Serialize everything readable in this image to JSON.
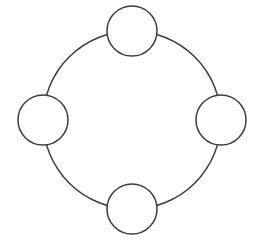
{
  "diagram": {
    "background_color": "#ffffff",
    "stroke_color": "#3c3c3c",
    "stroke_width": 1.5,
    "canvas": {
      "width": 257,
      "height": 248
    }
  },
  "chart_data": {
    "type": "diagram",
    "subtype": "ring-network-topology",
    "title": "",
    "ring": {
      "center_x": 132,
      "center_y": 120,
      "radius": 89,
      "label": "ring-backbone"
    },
    "nodes": [
      {
        "id": "node-top",
        "position": "top",
        "cx": 132,
        "cy": 31,
        "r": 25,
        "label": ""
      },
      {
        "id": "node-right",
        "position": "right",
        "cx": 221,
        "cy": 120,
        "r": 25,
        "label": ""
      },
      {
        "id": "node-bottom",
        "position": "bottom",
        "cx": 132,
        "cy": 209,
        "r": 25,
        "label": ""
      },
      {
        "id": "node-left",
        "position": "left",
        "cx": 43,
        "cy": 120,
        "r": 25,
        "label": ""
      }
    ],
    "edges": [
      {
        "from": "node-top",
        "to": "node-right",
        "shape": "arc"
      },
      {
        "from": "node-right",
        "to": "node-bottom",
        "shape": "arc"
      },
      {
        "from": "node-bottom",
        "to": "node-left",
        "shape": "arc"
      },
      {
        "from": "node-left",
        "to": "node-top",
        "shape": "arc"
      }
    ],
    "node_count": 4,
    "legend": [],
    "annotations": []
  }
}
